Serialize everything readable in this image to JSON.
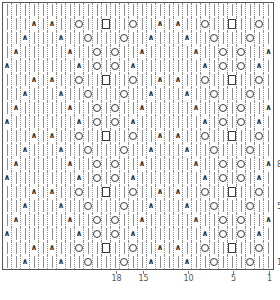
{
  "chart_data": {
    "type": "table",
    "xlabel": "stitch number",
    "ylabel": "row number",
    "grid": true,
    "legend_position": "none",
    "columns": 30,
    "rows": 19,
    "repeat_columns": 18,
    "repeat_rows": 8,
    "cell_width_px": 9,
    "cell_height_px": 14,
    "symbol_legend": {
      "knit": "|",
      "decrease": "∧",
      "yarn_over": "○",
      "square": "□"
    },
    "column_tick_labels": [
      "18",
      "15",
      "10",
      "5",
      "1"
    ],
    "column_tick_numbers": [
      18,
      15,
      10,
      5,
      1
    ],
    "column_tick_direction": "right-to-left",
    "row_tick_labels": [
      "8",
      "5",
      "1"
    ],
    "row_tick_numbers": [
      8,
      5,
      1
    ],
    "row_tick_direction": "bottom-to-top",
    "row_label_side": "right",
    "cells": [
      [
        "knit",
        "knit",
        "knit",
        "knit",
        "knit",
        "knit",
        "knit",
        "knit",
        "knit",
        "knit",
        "knit",
        "knit",
        "knit",
        "knit",
        "knit",
        "knit",
        "knit",
        "knit",
        "knit",
        "knit",
        "knit",
        "knit",
        "knit",
        "knit",
        "knit",
        "knit",
        "knit",
        "knit",
        "knit",
        "knit"
      ],
      [
        "knit",
        "knit",
        "knit",
        "dec",
        "knit",
        "dec",
        "knit",
        "knit",
        "yo",
        "knit",
        "knit",
        "square",
        "knit",
        "knit",
        "yo",
        "knit",
        "knit",
        "dec",
        "knit",
        "dec",
        "knit",
        "knit",
        "yo",
        "knit",
        "knit",
        "square",
        "knit",
        "knit",
        "yo",
        "knit"
      ],
      [
        "knit",
        "knit",
        "dec",
        "knit",
        "knit",
        "knit",
        "dec",
        "knit",
        "knit",
        "yo",
        "knit",
        "knit",
        "knit",
        "yo",
        "knit",
        "knit",
        "dec",
        "knit",
        "knit",
        "knit",
        "dec",
        "knit",
        "knit",
        "yo",
        "knit",
        "knit",
        "knit",
        "yo",
        "knit",
        "knit"
      ],
      [
        "knit",
        "dec",
        "knit",
        "knit",
        "knit",
        "knit",
        "knit",
        "dec",
        "knit",
        "knit",
        "yo",
        "knit",
        "yo",
        "knit",
        "knit",
        "dec",
        "knit",
        "knit",
        "knit",
        "knit",
        "knit",
        "dec",
        "knit",
        "knit",
        "yo",
        "knit",
        "yo",
        "knit",
        "knit",
        "dec"
      ],
      [
        "dec",
        "knit",
        "knit",
        "knit",
        "knit",
        "knit",
        "knit",
        "knit",
        "dec",
        "knit",
        "yo",
        "knit",
        "yo",
        "knit",
        "dec",
        "knit",
        "knit",
        "knit",
        "knit",
        "knit",
        "knit",
        "knit",
        "dec",
        "knit",
        "yo",
        "knit",
        "yo",
        "knit",
        "dec",
        "knit"
      ],
      [
        "knit",
        "knit",
        "knit",
        "dec",
        "knit",
        "dec",
        "knit",
        "knit",
        "yo",
        "knit",
        "knit",
        "square",
        "knit",
        "knit",
        "yo",
        "knit",
        "knit",
        "dec",
        "knit",
        "dec",
        "knit",
        "knit",
        "yo",
        "knit",
        "knit",
        "square",
        "knit",
        "knit",
        "yo",
        "knit"
      ],
      [
        "knit",
        "knit",
        "dec",
        "knit",
        "knit",
        "knit",
        "dec",
        "knit",
        "knit",
        "yo",
        "knit",
        "knit",
        "knit",
        "yo",
        "knit",
        "knit",
        "dec",
        "knit",
        "knit",
        "knit",
        "dec",
        "knit",
        "knit",
        "yo",
        "knit",
        "knit",
        "knit",
        "yo",
        "knit",
        "knit"
      ],
      [
        "knit",
        "dec",
        "knit",
        "knit",
        "knit",
        "knit",
        "knit",
        "dec",
        "knit",
        "knit",
        "yo",
        "knit",
        "yo",
        "knit",
        "knit",
        "dec",
        "knit",
        "knit",
        "knit",
        "knit",
        "knit",
        "dec",
        "knit",
        "knit",
        "yo",
        "knit",
        "yo",
        "knit",
        "knit",
        "dec"
      ],
      [
        "dec",
        "knit",
        "knit",
        "knit",
        "knit",
        "knit",
        "knit",
        "knit",
        "dec",
        "knit",
        "yo",
        "knit",
        "yo",
        "knit",
        "dec",
        "knit",
        "knit",
        "knit",
        "knit",
        "knit",
        "knit",
        "knit",
        "dec",
        "knit",
        "yo",
        "knit",
        "yo",
        "knit",
        "dec",
        "knit"
      ],
      [
        "knit",
        "knit",
        "knit",
        "dec",
        "knit",
        "dec",
        "knit",
        "knit",
        "yo",
        "knit",
        "knit",
        "square",
        "knit",
        "knit",
        "yo",
        "knit",
        "knit",
        "dec",
        "knit",
        "dec",
        "knit",
        "knit",
        "yo",
        "knit",
        "knit",
        "square",
        "knit",
        "knit",
        "yo",
        "knit"
      ],
      [
        "knit",
        "knit",
        "dec",
        "knit",
        "knit",
        "knit",
        "dec",
        "knit",
        "knit",
        "yo",
        "knit",
        "knit",
        "knit",
        "yo",
        "knit",
        "knit",
        "dec",
        "knit",
        "knit",
        "knit",
        "dec",
        "knit",
        "knit",
        "yo",
        "knit",
        "knit",
        "knit",
        "yo",
        "knit",
        "knit"
      ],
      [
        "knit",
        "dec",
        "knit",
        "knit",
        "knit",
        "knit",
        "knit",
        "dec",
        "knit",
        "knit",
        "yo",
        "knit",
        "yo",
        "knit",
        "knit",
        "dec",
        "knit",
        "knit",
        "knit",
        "knit",
        "knit",
        "dec",
        "knit",
        "knit",
        "yo",
        "knit",
        "yo",
        "knit",
        "knit",
        "dec"
      ],
      [
        "dec",
        "knit",
        "knit",
        "knit",
        "knit",
        "knit",
        "knit",
        "knit",
        "dec",
        "knit",
        "yo",
        "knit",
        "yo",
        "knit",
        "dec",
        "knit",
        "knit",
        "knit",
        "knit",
        "knit",
        "knit",
        "knit",
        "dec",
        "knit",
        "yo",
        "knit",
        "yo",
        "knit",
        "dec",
        "knit"
      ],
      [
        "knit",
        "knit",
        "knit",
        "dec",
        "knit",
        "dec",
        "knit",
        "knit",
        "yo",
        "knit",
        "knit",
        "square",
        "knit",
        "knit",
        "yo",
        "knit",
        "knit",
        "dec",
        "knit",
        "dec",
        "knit",
        "knit",
        "yo",
        "knit",
        "knit",
        "square",
        "knit",
        "knit",
        "yo",
        "knit"
      ],
      [
        "knit",
        "knit",
        "dec",
        "knit",
        "knit",
        "knit",
        "dec",
        "knit",
        "knit",
        "yo",
        "knit",
        "knit",
        "knit",
        "yo",
        "knit",
        "knit",
        "dec",
        "knit",
        "knit",
        "knit",
        "dec",
        "knit",
        "knit",
        "yo",
        "knit",
        "knit",
        "knit",
        "yo",
        "knit",
        "knit"
      ],
      [
        "knit",
        "dec",
        "knit",
        "knit",
        "knit",
        "knit",
        "knit",
        "dec",
        "knit",
        "knit",
        "yo",
        "knit",
        "yo",
        "knit",
        "knit",
        "dec",
        "knit",
        "knit",
        "knit",
        "knit",
        "knit",
        "dec",
        "knit",
        "knit",
        "yo",
        "knit",
        "yo",
        "knit",
        "knit",
        "dec"
      ],
      [
        "dec",
        "knit",
        "knit",
        "knit",
        "knit",
        "knit",
        "knit",
        "knit",
        "dec",
        "knit",
        "yo",
        "knit",
        "yo",
        "knit",
        "dec",
        "knit",
        "knit",
        "knit",
        "knit",
        "knit",
        "knit",
        "knit",
        "dec",
        "knit",
        "yo",
        "knit",
        "yo",
        "knit",
        "dec",
        "knit"
      ],
      [
        "knit",
        "knit",
        "knit",
        "dec",
        "knit",
        "dec",
        "knit",
        "knit",
        "yo",
        "knit",
        "knit",
        "square",
        "knit",
        "knit",
        "yo",
        "knit",
        "knit",
        "dec",
        "knit",
        "dec",
        "knit",
        "knit",
        "yo",
        "knit",
        "knit",
        "square",
        "knit",
        "knit",
        "yo",
        "knit"
      ],
      [
        "knit",
        "knit",
        "dec",
        "knit",
        "knit",
        "knit",
        "dec",
        "knit",
        "knit",
        "yo",
        "knit",
        "knit",
        "knit",
        "yo",
        "knit",
        "knit",
        "dec",
        "knit",
        "knit",
        "knit",
        "dec",
        "knit",
        "knit",
        "yo",
        "knit",
        "knit",
        "knit",
        "yo",
        "knit",
        "knit"
      ]
    ]
  }
}
